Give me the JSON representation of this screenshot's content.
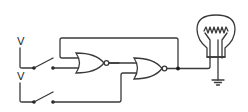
{
  "diagram": {
    "type": "logic-circuit",
    "colors": {
      "line": "#3a3a3a",
      "background": "#ffffff",
      "junction": "#1a1a1a"
    },
    "inputs": [
      {
        "id": "input-1",
        "label": "V",
        "switch": "switch-1",
        "state": "open"
      },
      {
        "id": "input-2",
        "label": "V",
        "switch": "switch-2",
        "state": "open"
      }
    ],
    "gates": [
      {
        "id": "nor-1",
        "type": "NOR"
      },
      {
        "id": "nor-2",
        "type": "NOR"
      }
    ],
    "output": {
      "id": "bulb",
      "type": "light-bulb",
      "grounded": true
    },
    "connections": [
      "switch-1 -> nor-1.input-b",
      "nor-1.output -> nor-2.input-a",
      "switch-2 -> nor-2.input-b",
      "nor-2.output -> bulb",
      "nor-2.output -> nor-1.input-a (feedback)"
    ]
  }
}
